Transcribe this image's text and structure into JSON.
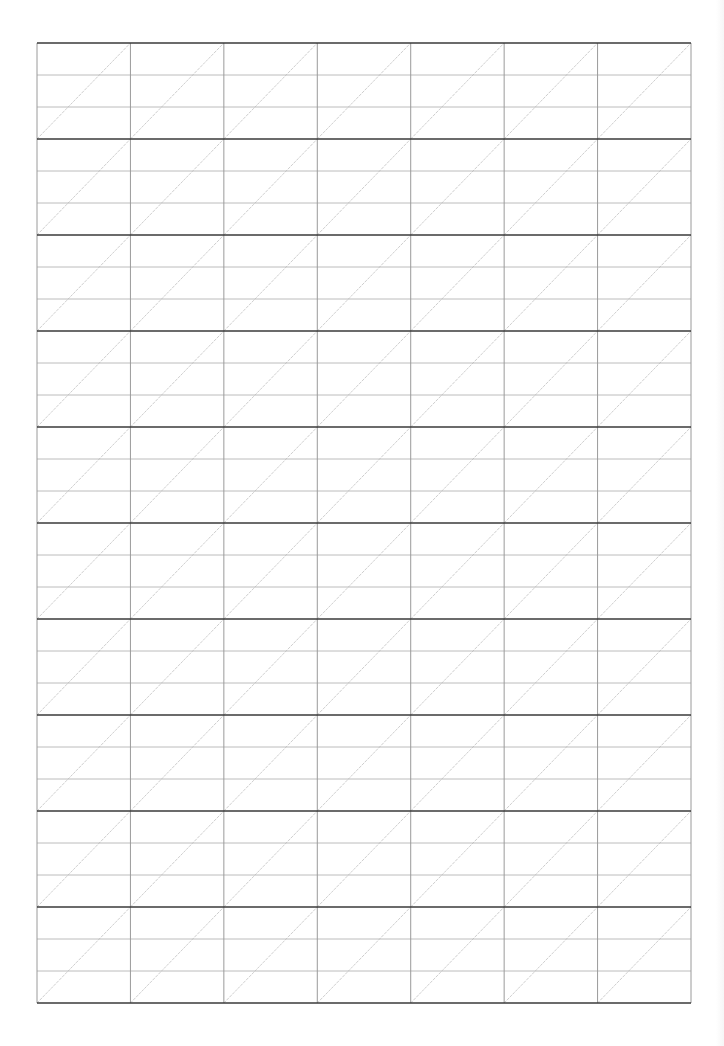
{
  "document": {
    "title": "Handwriting practice grid sheet",
    "type": "practice-grid"
  },
  "grid": {
    "left": 37,
    "top": 43,
    "right": 691,
    "bottom": 1003,
    "columns": 7,
    "bands": 10,
    "sub_rows_per_band": 3,
    "diagonal": "bottom-left-to-top-right",
    "colors": {
      "band_line": "#3a3a3a",
      "sub_row_line": "#b4b4b4",
      "column_line": "#9a9a9a",
      "diagonal_line": "#c8c8c8",
      "background": "#ffffff"
    }
  }
}
